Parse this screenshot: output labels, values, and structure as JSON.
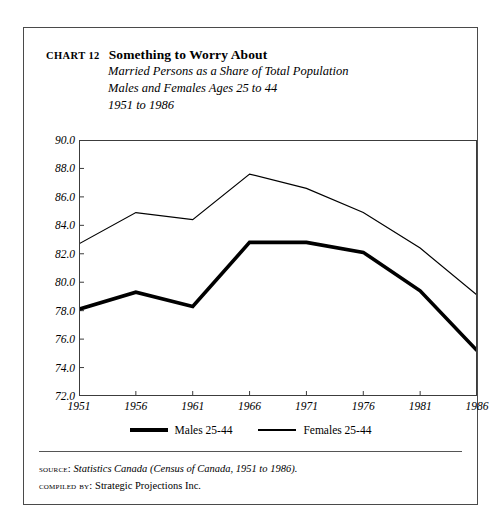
{
  "chart_number": "Chart 12",
  "title": "Something to Worry About",
  "subtitles": [
    "Married Persons as a Share of Total Population",
    "Males and Females Ages 25 to 44",
    "1951 to 1986"
  ],
  "legend": {
    "males_label": "Males 25-44",
    "females_label": "Females 25-44"
  },
  "footer": {
    "source_label": "Source:",
    "source_text": "Statistics Canada (Census of Canada, 1951 to 1986).",
    "compiled_label": "Compiled by:",
    "compiled_text": "Strategic Projections Inc."
  },
  "colors": {
    "line": "#000000",
    "frame": "#3c3c3c",
    "outer_frame": "#4a4a4a",
    "background": "#ffffff"
  },
  "chart_data": {
    "type": "line",
    "title": "Something to Worry About",
    "subtitle": "Married Persons as a Share of Total Population, Males and Females Ages 25 to 44, 1951 to 1986",
    "xlabel": "",
    "ylabel": "",
    "x": [
      1951,
      1956,
      1961,
      1966,
      1971,
      1976,
      1981,
      1986
    ],
    "xtick_labels": [
      "1951",
      "1956",
      "1961",
      "1966",
      "1971",
      "1976",
      "1981",
      "1986"
    ],
    "ytick_labels": [
      "72.0",
      "74.0",
      "76.0",
      "78.0",
      "80.0",
      "82.0",
      "84.0",
      "86.0",
      "88.0",
      "90.0"
    ],
    "yticks": [
      72.0,
      74.0,
      76.0,
      78.0,
      80.0,
      82.0,
      84.0,
      86.0,
      88.0,
      90.0
    ],
    "ylim": [
      72.0,
      90.0
    ],
    "xlim": [
      1951,
      1986
    ],
    "grid": false,
    "legend_position": "below-axes",
    "series": [
      {
        "name": "Males 25-44",
        "style": "thick",
        "values": [
          78.1,
          79.3,
          78.3,
          82.8,
          82.8,
          82.1,
          79.4,
          75.2
        ]
      },
      {
        "name": "Females 25-44",
        "style": "thin",
        "values": [
          82.7,
          84.9,
          84.4,
          87.6,
          86.6,
          84.9,
          82.4,
          79.1
        ]
      }
    ]
  }
}
